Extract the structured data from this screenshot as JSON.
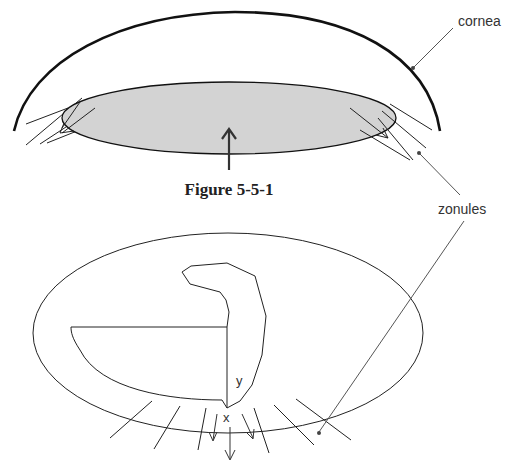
{
  "figure": {
    "caption": "Figure 5-5-1",
    "labels": {
      "cornea": "cornea",
      "zonules": "zonules",
      "point_x": "x",
      "point_y": "y"
    },
    "colors": {
      "line": "#1a1a1a",
      "lens_fill": "#d3d3d3",
      "leader": "#555555",
      "background": "#ffffff"
    }
  }
}
